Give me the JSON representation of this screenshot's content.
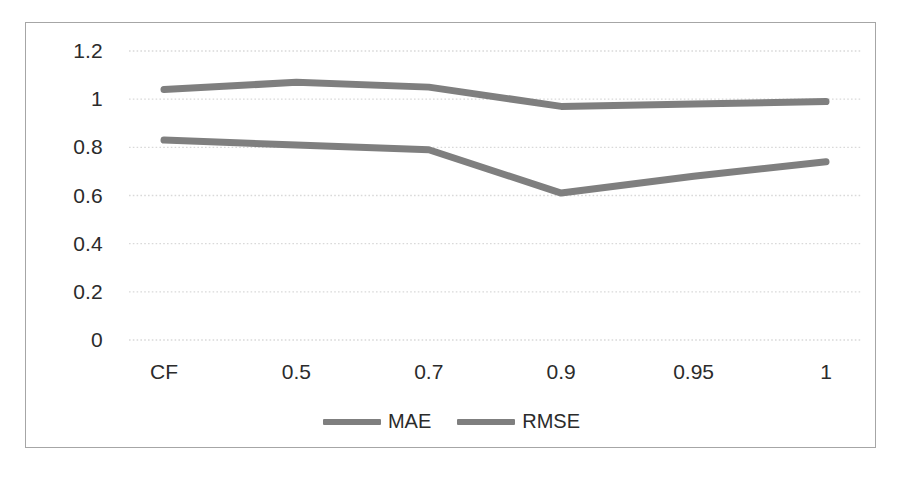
{
  "chart_data": {
    "type": "line",
    "title": "",
    "subtitle": "",
    "xlabel": "",
    "ylabel": "",
    "categories": [
      "CF",
      "0.5",
      "0.7",
      "0.9",
      "0.95",
      "1"
    ],
    "series": [
      {
        "name": "MAE",
        "values": [
          0.83,
          0.81,
          0.79,
          0.61,
          0.68,
          0.74
        ],
        "color": "#7f7f7f"
      },
      {
        "name": "RMSE",
        "values": [
          1.04,
          1.07,
          1.05,
          0.97,
          0.98,
          0.99
        ],
        "color": "#7f7f7f"
      }
    ],
    "ylim": [
      0,
      1.2
    ],
    "y_ticks": [
      0,
      0.2,
      0.4,
      0.6,
      0.8,
      1,
      1.2
    ],
    "y_tick_labels": [
      "0",
      "0.2",
      "0.4",
      "0.6",
      "0.8",
      "1",
      "1.2"
    ],
    "grid": true,
    "grid_axis": "y",
    "grid_style": "dotted",
    "grid_color": "#d9d9d9",
    "legend": true,
    "legend_position": "bottom",
    "legend_entries": [
      "MAE",
      "RMSE"
    ],
    "axis_line_color": "#a6a6a6",
    "plot_background": "#ffffff",
    "border": true
  },
  "chart": {
    "frame_name": "chart-frame"
  }
}
